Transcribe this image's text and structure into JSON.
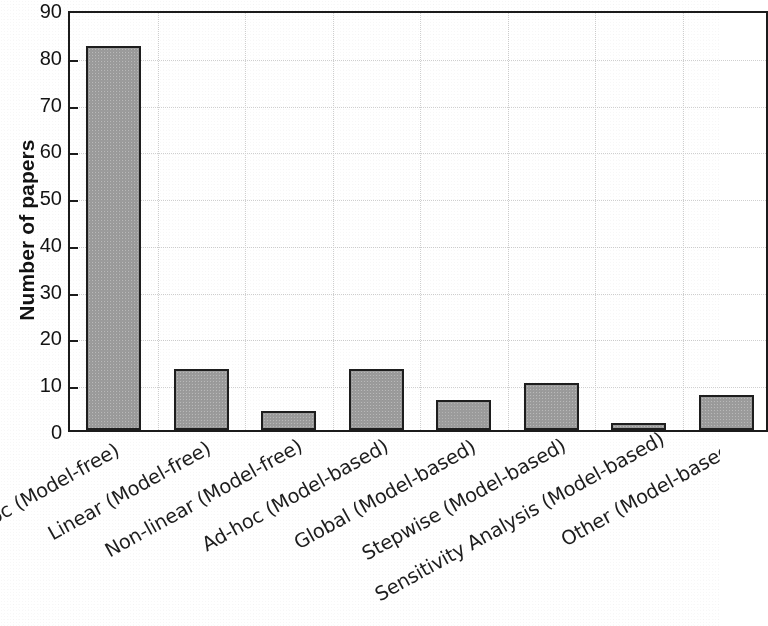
{
  "chart_data": {
    "type": "bar",
    "title": "",
    "xlabel": "",
    "ylabel": "Number of papers",
    "ylim": [
      0,
      90
    ],
    "yticks": [
      0,
      10,
      20,
      30,
      40,
      50,
      60,
      70,
      80,
      90
    ],
    "ytick_labels": [
      "0",
      "10",
      "20",
      "30",
      "40",
      "50",
      "60",
      "70",
      "80",
      "90"
    ],
    "grid": "dotted-both-axes",
    "legend": "none",
    "bar_color": "#9b9b9b",
    "bar_edge_color": "#1e1e1e",
    "axis_color": "#1b1b1b",
    "grid_color": "#cfcfcf",
    "note": "left-most category label is clipped by the image crop",
    "categories": [
      "Ad-hoc (Model-free)",
      "Linear (Model-free)",
      "Non-linear (Model-free)",
      "Ad-hoc (Model-based)",
      "Global (Model-based)",
      "Stepwise (Model-based)",
      "Sensitivity Analysis (Model-based)",
      "Other (Model-based)"
    ],
    "category_labels_rendered": [
      "oc (Model-free)",
      "Linear (Model-free)",
      "Non-linear (Model-free)",
      "Ad-hoc (Model-based)",
      "Global (Model-based)",
      "Stepwise (Model-based)",
      "Sensitivity Analysis (Model-based)",
      "Other (Model-based)"
    ],
    "values": [
      82,
      13,
      4,
      13,
      6.5,
      10,
      1.5,
      7.5
    ]
  }
}
